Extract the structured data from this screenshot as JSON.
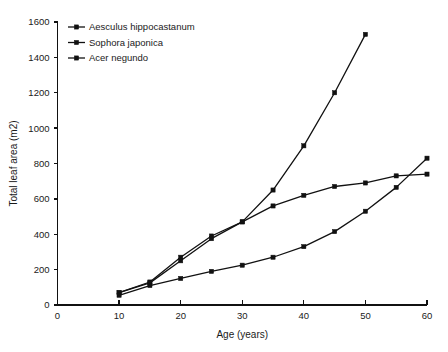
{
  "chart_data": {
    "type": "line",
    "title": "",
    "subtitle": "",
    "xlabel": "Age (years)",
    "ylabel": "Total leaf area (m2)",
    "xlim": [
      0,
      60
    ],
    "ylim": [
      0,
      1600
    ],
    "xticks": [
      0,
      10,
      20,
      30,
      40,
      50,
      60
    ],
    "yticks": [
      0,
      200,
      400,
      600,
      800,
      1000,
      1200,
      1400,
      1600
    ],
    "xtick_labels": [
      "0",
      "10",
      "20",
      "30",
      "40",
      "50",
      "60"
    ],
    "ytick_labels": [
      "0",
      "200",
      "400",
      "600",
      "800",
      "1000",
      "1200",
      "1400",
      "1600"
    ],
    "grid": false,
    "legend_position": "top-left",
    "marker": "square",
    "line_color": "#111111",
    "series": [
      {
        "name": "Aesculus hippocastanum",
        "marker": "square",
        "x": [
          10,
          15,
          20,
          25,
          30,
          35,
          40,
          45,
          50
        ],
        "values": [
          70,
          125,
          250,
          375,
          470,
          650,
          900,
          1200,
          1530
        ]
      },
      {
        "name": "Sophora japonica",
        "marker": "square",
        "x": [
          10,
          15,
          20,
          25,
          30,
          35,
          40,
          45,
          50,
          55,
          60
        ],
        "values": [
          70,
          130,
          270,
          390,
          470,
          560,
          620,
          670,
          690,
          730,
          740
        ]
      },
      {
        "name": "Acer negundo",
        "marker": "square",
        "x": [
          10,
          15,
          20,
          25,
          30,
          35,
          40,
          45,
          50,
          55,
          60
        ],
        "values": [
          55,
          110,
          150,
          190,
          225,
          270,
          330,
          415,
          530,
          665,
          830
        ]
      }
    ]
  },
  "legend": {
    "entries": [
      {
        "label": "Aesculus hippocastanum"
      },
      {
        "label": "Sophora japonica"
      },
      {
        "label": "Acer negundo"
      }
    ]
  }
}
